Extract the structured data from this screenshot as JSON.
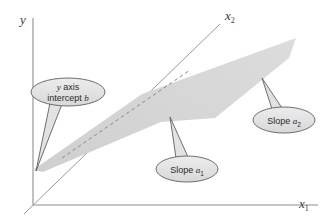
{
  "figure": {
    "background_color": "#ffffff",
    "plane_fill_color": "#d4d4d4",
    "axis_color": "#8a8a8a",
    "callout_fill_color": "#e0e0e0",
    "callout_border_color": "#6b6b6b",
    "text_color": "#2b2b2b"
  },
  "axes": [
    {
      "id": "y-axis",
      "label": "y",
      "subscript": "",
      "label_x": 20,
      "label_y": 24,
      "orientation": "vertical"
    },
    {
      "id": "x1-axis",
      "label": "x",
      "subscript": "1",
      "label_x": 299,
      "label_y": 208,
      "orientation": "horizontal"
    },
    {
      "id": "x2-axis",
      "label": "x",
      "subscript": "2",
      "label_x": 225,
      "label_y": 20,
      "orientation": "diagonal"
    }
  ],
  "callouts": [
    {
      "id": "y-intercept",
      "name": "y-axis-intercept-callout",
      "line1_pre": "y",
      "line1_post": " axis",
      "line2_pre": "intercept ",
      "line2_post": "b",
      "subscript": "",
      "ellipse_cx": 68,
      "ellipse_cy": 92,
      "ellipse_rx": 37,
      "ellipse_ry": 14,
      "tail_tip_x": 34,
      "tail_tip_y": 171
    },
    {
      "id": "slope-a1",
      "name": "slope-a1-callout",
      "line1_pre": "Slope ",
      "line1_post": "a",
      "subscript": "1",
      "ellipse_cx": 187,
      "ellipse_cy": 169,
      "ellipse_rx": 31,
      "ellipse_ry": 13,
      "tail_tip_x": 170,
      "tail_tip_y": 117
    },
    {
      "id": "slope-a2",
      "name": "slope-a2-callout",
      "line1_pre": "Slope ",
      "line1_post": "a",
      "subscript": "2",
      "ellipse_cx": 284,
      "ellipse_cy": 120,
      "ellipse_rx": 31,
      "ellipse_ry": 13,
      "tail_tip_x": 262,
      "tail_tip_y": 78
    }
  ],
  "plane": {
    "name": "regression-plane",
    "points": "43,172 33,170 142,94 296,38 289,58 215,118 161,122"
  },
  "dashed_line": {
    "name": "plane-intersection-dashed-line",
    "x1": 62,
    "y1": 158,
    "x2": 190,
    "y2": 70
  }
}
